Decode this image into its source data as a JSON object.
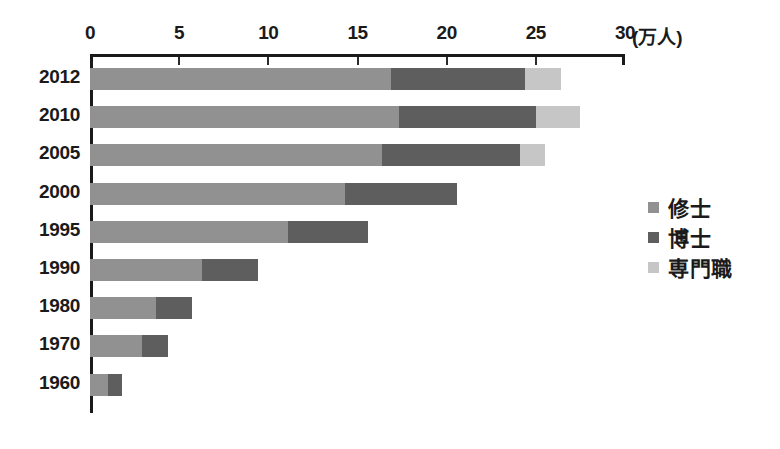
{
  "chart_data": {
    "type": "bar",
    "orientation": "horizontal",
    "stacked": true,
    "title": "",
    "xlabel": "(万人)",
    "ylabel": "",
    "xlim": [
      0,
      30
    ],
    "xticks": [
      0,
      5,
      10,
      15,
      20,
      25,
      30
    ],
    "xtick_labels": [
      "0",
      "5",
      "10",
      "15",
      "20",
      "25",
      "30"
    ],
    "unit_label": "(万人)",
    "grid": false,
    "legend_position": "right",
    "categories": [
      "2012",
      "2010",
      "2005",
      "2000",
      "1995",
      "1990",
      "1980",
      "1970",
      "1960"
    ],
    "series": [
      {
        "name": "修士",
        "color": "#919191",
        "values": [
          16.9,
          17.3,
          16.4,
          14.3,
          11.1,
          6.3,
          3.7,
          2.9,
          1.0
        ]
      },
      {
        "name": "博士",
        "color": "#5e5e5e",
        "values": [
          7.5,
          7.7,
          7.7,
          6.3,
          4.5,
          3.1,
          2.0,
          1.5,
          0.8
        ]
      },
      {
        "name": "専門職",
        "color": "#c6c6c6",
        "values": [
          2.0,
          2.5,
          1.4,
          0.0,
          0.0,
          0.0,
          0.0,
          0.0,
          0.0
        ]
      }
    ],
    "totals": [
      26.4,
      27.5,
      25.5,
      20.6,
      15.6,
      9.4,
      5.7,
      4.4,
      1.8
    ]
  },
  "legend": {
    "items": [
      {
        "label": "修士",
        "color": "#919191"
      },
      {
        "label": "博士",
        "color": "#5e5e5e"
      },
      {
        "label": "専門職",
        "color": "#c6c6c6"
      }
    ]
  }
}
